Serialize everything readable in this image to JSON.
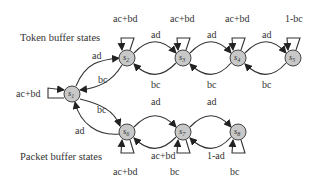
{
  "diagram": {
    "type": "state-transition diagram",
    "group_labels": {
      "token": "Token buffer states",
      "packet": "Packet buffer states"
    },
    "nodes": [
      {
        "id": "s1",
        "label": "s",
        "sub": "1",
        "x": 72,
        "y": 94
      },
      {
        "id": "s2",
        "label": "s",
        "sub": "2",
        "x": 127,
        "y": 58
      },
      {
        "id": "s3",
        "label": "s",
        "sub": "3",
        "x": 183,
        "y": 58
      },
      {
        "id": "s4",
        "label": "s",
        "sub": "4",
        "x": 238,
        "y": 58
      },
      {
        "id": "s5",
        "label": "s",
        "sub": "5",
        "x": 293,
        "y": 58
      },
      {
        "id": "s6",
        "label": "s",
        "sub": "6",
        "x": 127,
        "y": 132
      },
      {
        "id": "s7",
        "label": "s",
        "sub": "7",
        "x": 183,
        "y": 132
      },
      {
        "id": "s8",
        "label": "s",
        "sub": "8",
        "x": 238,
        "y": 132
      }
    ],
    "edges": [
      {
        "from": "s1",
        "to": "s1",
        "label": "ac+bd"
      },
      {
        "from": "s1",
        "to": "s2",
        "label": "ad"
      },
      {
        "from": "s2",
        "to": "s1",
        "label": "bc"
      },
      {
        "from": "s1",
        "to": "s6",
        "label": "bc"
      },
      {
        "from": "s6",
        "to": "s1",
        "label": "ad"
      },
      {
        "from": "s2",
        "to": "s2",
        "label": "ac+bd"
      },
      {
        "from": "s2",
        "to": "s3",
        "label": "ad"
      },
      {
        "from": "s3",
        "to": "s2",
        "label": "bc"
      },
      {
        "from": "s3",
        "to": "s3",
        "label": "ac+bd"
      },
      {
        "from": "s3",
        "to": "s4",
        "label": "ad"
      },
      {
        "from": "s4",
        "to": "s3",
        "label": "bc"
      },
      {
        "from": "s4",
        "to": "s4",
        "label": "ac+bd"
      },
      {
        "from": "s4",
        "to": "s5",
        "label": "ad"
      },
      {
        "from": "s5",
        "to": "s4",
        "label": "bc"
      },
      {
        "from": "s5",
        "to": "s5",
        "label": "1-bc"
      },
      {
        "from": "s6",
        "to": "s6",
        "label": "ac+bd"
      },
      {
        "from": "s6",
        "to": "s7",
        "label": "bc"
      },
      {
        "from": "s7",
        "to": "s6",
        "label": "ad"
      },
      {
        "from": "s7",
        "to": "s7",
        "label": "ac+bd"
      },
      {
        "from": "s7",
        "to": "s8",
        "label": "bc"
      },
      {
        "from": "s8",
        "to": "s7",
        "label": "ad"
      },
      {
        "from": "s8",
        "to": "s8",
        "label": "1-ad"
      }
    ]
  }
}
